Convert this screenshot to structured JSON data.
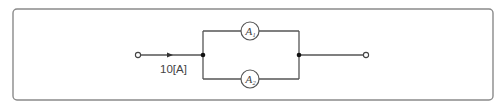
{
  "diagram": {
    "type": "circuit",
    "input_current_label": "10[A]",
    "ammeters": [
      {
        "id": "A1",
        "label": "A",
        "subscript": "1",
        "branch": "top"
      },
      {
        "id": "A2",
        "label": "A",
        "subscript": "2",
        "branch": "bottom"
      }
    ],
    "terminals": [
      "input",
      "output"
    ],
    "nodes": [
      "left-junction",
      "right-junction"
    ],
    "colors": {
      "wire": "#555555",
      "frame": "#8a8a8a",
      "node": "#111111",
      "background": "#ffffff"
    }
  }
}
